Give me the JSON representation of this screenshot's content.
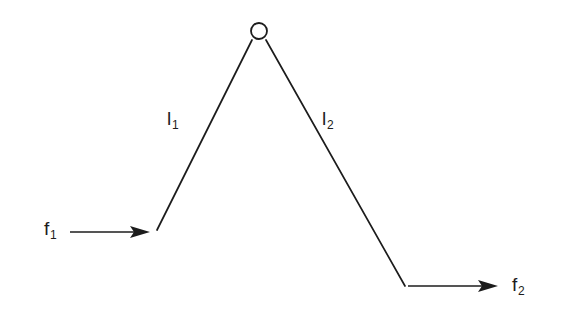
{
  "figure": {
    "background_color": "#ffffff",
    "stroke_color": "#1c1c1c",
    "width": 565,
    "height": 316
  },
  "labels": {
    "input_force": {
      "base": "f",
      "sub": "1",
      "text": "f1"
    },
    "link_left": {
      "base": "l",
      "sub": "1",
      "text": "l1"
    },
    "link_right": {
      "base": "l",
      "sub": "2",
      "text": "l2"
    },
    "output_force": {
      "base": "f",
      "sub": "2",
      "text": "f2"
    }
  },
  "geometry": {
    "joint": {
      "cx": 259,
      "cy": 31,
      "r": 8
    },
    "link_left": {
      "x1": 157,
      "y1": 230,
      "x2": 252,
      "y2": 40
    },
    "link_right": {
      "x1": 266,
      "y1": 40,
      "x2": 405,
      "y2": 286
    },
    "arrow_input": {
      "x1": 70,
      "y1": 232,
      "x2": 150,
      "y2": 232
    },
    "arrow_output": {
      "x1": 408,
      "y1": 286,
      "x2": 498,
      "y2": 286
    }
  }
}
